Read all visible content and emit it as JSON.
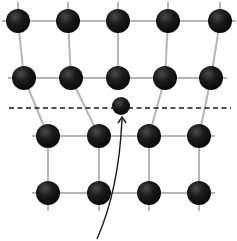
{
  "diagram": {
    "colors": {
      "background": "#ffffff",
      "bond": "#b5b5b5",
      "atom": "#121212",
      "atom_highlight": "#4a4a4a",
      "dashed_line": "#1a1a1a",
      "arrow": "#1a1a1a"
    },
    "atom_radius": 12,
    "rows": [
      {
        "name": "row-1",
        "y": 21,
        "xs": [
          18,
          68,
          118,
          168,
          220
        ]
      },
      {
        "name": "row-2",
        "y": 78,
        "xs": [
          24,
          71,
          118,
          165,
          211
        ]
      },
      {
        "name": "row-3",
        "y": 136,
        "xs": [
          48,
          99,
          149,
          199
        ]
      },
      {
        "name": "row-4",
        "y": 193,
        "xs": [
          48,
          99,
          149,
          199
        ]
      }
    ],
    "interstitial_atom": {
      "x": 121,
      "y": 106,
      "r": 9
    },
    "dashed_line": {
      "x1": 9,
      "x2": 231,
      "y": 108
    },
    "arrow": {
      "path": "M 97 239 C 112 205, 120 165, 122 119",
      "head_x": 122,
      "head_y": 117
    }
  }
}
